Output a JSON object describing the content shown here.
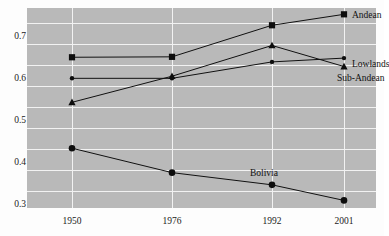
{
  "chart_data": {
    "type": "line",
    "title": "",
    "subtitle": "",
    "xlabel": "",
    "ylabel": "",
    "x": [
      "1950",
      "1976",
      "1992",
      "2001"
    ],
    "categories": [
      "1950",
      "1976",
      "1992",
      "2001"
    ],
    "ylim": [
      0.25,
      0.725
    ],
    "xlim": [
      0,
      3
    ],
    "yticks": [
      "0.3",
      "0.4",
      "0.5",
      "0.6",
      "0.7"
    ],
    "ytick_values": [
      0.3,
      0.4,
      0.5,
      0.6,
      0.7
    ],
    "gridlines": [
      0.25,
      0.3,
      0.35,
      0.4,
      0.45,
      0.5,
      0.55,
      0.6,
      0.65,
      0.7
    ],
    "grid": true,
    "grid_color": "#f2f2f2",
    "plot_background": "#b9b9b9",
    "legend_position": "right-edge-labels",
    "series": [
      {
        "name": "Andean",
        "marker": "square",
        "label_position": "right",
        "values": [
          0.608,
          0.609,
          0.684,
          0.71
        ]
      },
      {
        "name": "Lowlands",
        "marker": "circle",
        "label_position": "right",
        "values": [
          0.558,
          0.558,
          0.597,
          0.606
        ]
      },
      {
        "name": "Sub-Andean",
        "marker": "triangle",
        "label_position": "right",
        "values": [
          0.501,
          0.563,
          0.636,
          0.586
        ]
      },
      {
        "name": "Bolivia",
        "marker": "diamond",
        "label_position": "inline",
        "values": [
          0.392,
          0.334,
          0.305,
          0.268
        ]
      }
    ]
  },
  "labels": {
    "andean": "Andean",
    "lowlands": "Lowlands",
    "sub_andean": "Sub-Andean",
    "bolivia": "Bolivia"
  },
  "xticks": {
    "t0": "1950",
    "t1": "1976",
    "t2": "1992",
    "t3": "2001"
  },
  "yticks": {
    "t03": "0.3",
    "t04": "0.4",
    "t05": "0.5",
    "t06": "0.6",
    "t07": "0.7"
  }
}
